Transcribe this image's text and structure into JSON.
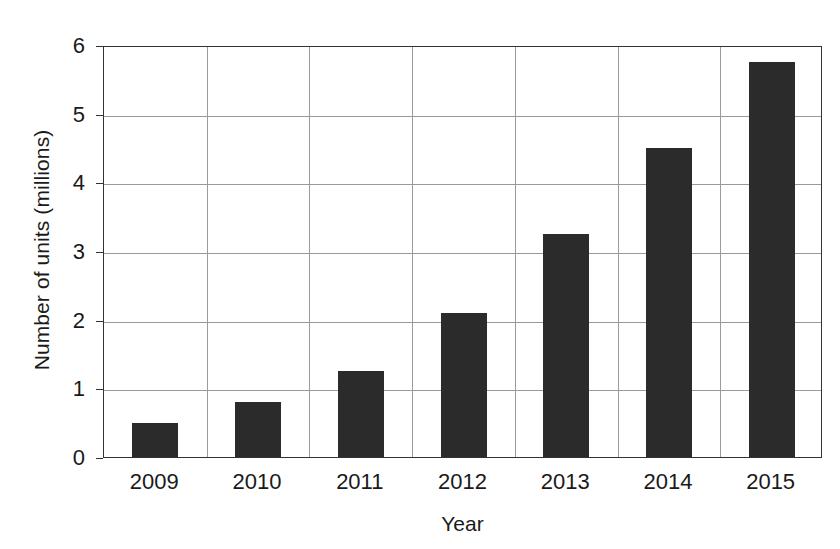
{
  "chart_data": {
    "type": "bar",
    "title": "",
    "xlabel": "Year",
    "ylabel": "Number of units (millions)",
    "categories": [
      "2009",
      "2010",
      "2011",
      "2012",
      "2013",
      "2014",
      "2015"
    ],
    "values": [
      0.5,
      0.8,
      1.25,
      2.1,
      3.25,
      4.5,
      5.75
    ],
    "ylim": [
      0,
      6
    ],
    "y_ticks": [
      "0",
      "1",
      "2",
      "3",
      "4",
      "5",
      "6"
    ],
    "y_tick_values": [
      0,
      1,
      2,
      3,
      4,
      5,
      6
    ],
    "grid": "horizontal-and-vertical",
    "legend": "none",
    "bar_color": "#2b2b2b",
    "grid_color": "#9a9a9a",
    "axis_color": "#333333",
    "background_color": "#ffffff"
  }
}
